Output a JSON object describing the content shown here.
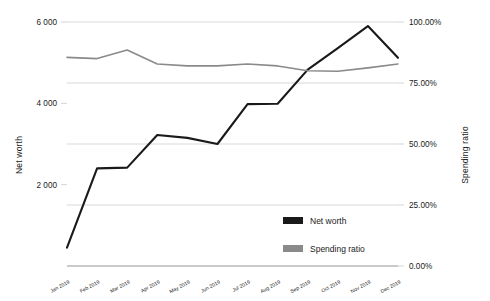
{
  "chart_data": {
    "type": "line",
    "title": "",
    "xlabel": "",
    "categories": [
      "Jan 2019",
      "Feb 2019",
      "Mar 2019",
      "Apr 2019",
      "May 2019",
      "Jun 2019",
      "Jul 2019",
      "Aug 2019",
      "Sep 2019",
      "Oct 2019",
      "Nov 2019",
      "Dec 2019"
    ],
    "grid": true,
    "legend_position": "inside-bottom-right",
    "series": [
      {
        "name": "Net worth",
        "axis": "left",
        "color": "#1a1a1a",
        "values": [
          450,
          2400,
          2420,
          3220,
          3150,
          3000,
          3980,
          3990,
          4830,
          5360,
          5900,
          5120
        ]
      },
      {
        "name": "Spending ratio",
        "axis": "right",
        "color": "#8a8a8a",
        "values": [
          0.855,
          0.85,
          0.885,
          0.828,
          0.82,
          0.82,
          0.828,
          0.82,
          0.8,
          0.798,
          0.812,
          0.828
        ]
      }
    ],
    "left_axis": {
      "label": "Net worth",
      "ticks": [
        2000,
        4000,
        6000
      ],
      "tick_labels": [
        "2 000",
        "4 000",
        "6 000"
      ],
      "ylim": [
        0,
        6000
      ]
    },
    "right_axis": {
      "label": "Spending ratio",
      "ticks": [
        0,
        0.25,
        0.5,
        0.75,
        1.0
      ],
      "tick_labels": [
        "0.00%",
        "25.00%",
        "50.00%",
        "75.00%",
        "100.00%"
      ],
      "ylim": [
        0,
        1.0
      ]
    },
    "legend": [
      {
        "label": "Net worth",
        "color": "#1a1a1a"
      },
      {
        "label": "Spending ratio",
        "color": "#8a8a8a"
      }
    ]
  }
}
